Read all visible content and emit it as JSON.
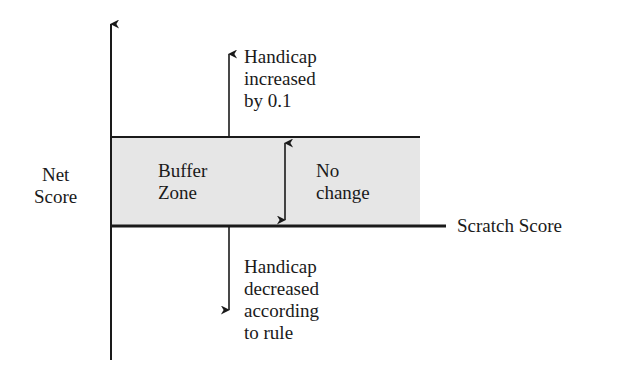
{
  "diagram": {
    "y_axis_label": "Net\nScore",
    "band_label": "Buffer\nZone",
    "no_change_label": "No\nchange",
    "baseline_label": "Scratch Score",
    "above_label": "Handicap\nincreased\nby 0.1",
    "below_label": "Handicap\ndecreased\naccording\nto rule",
    "colors": {
      "line": "#1a1a1a",
      "buffer_fill": "#e6e6e6"
    }
  }
}
